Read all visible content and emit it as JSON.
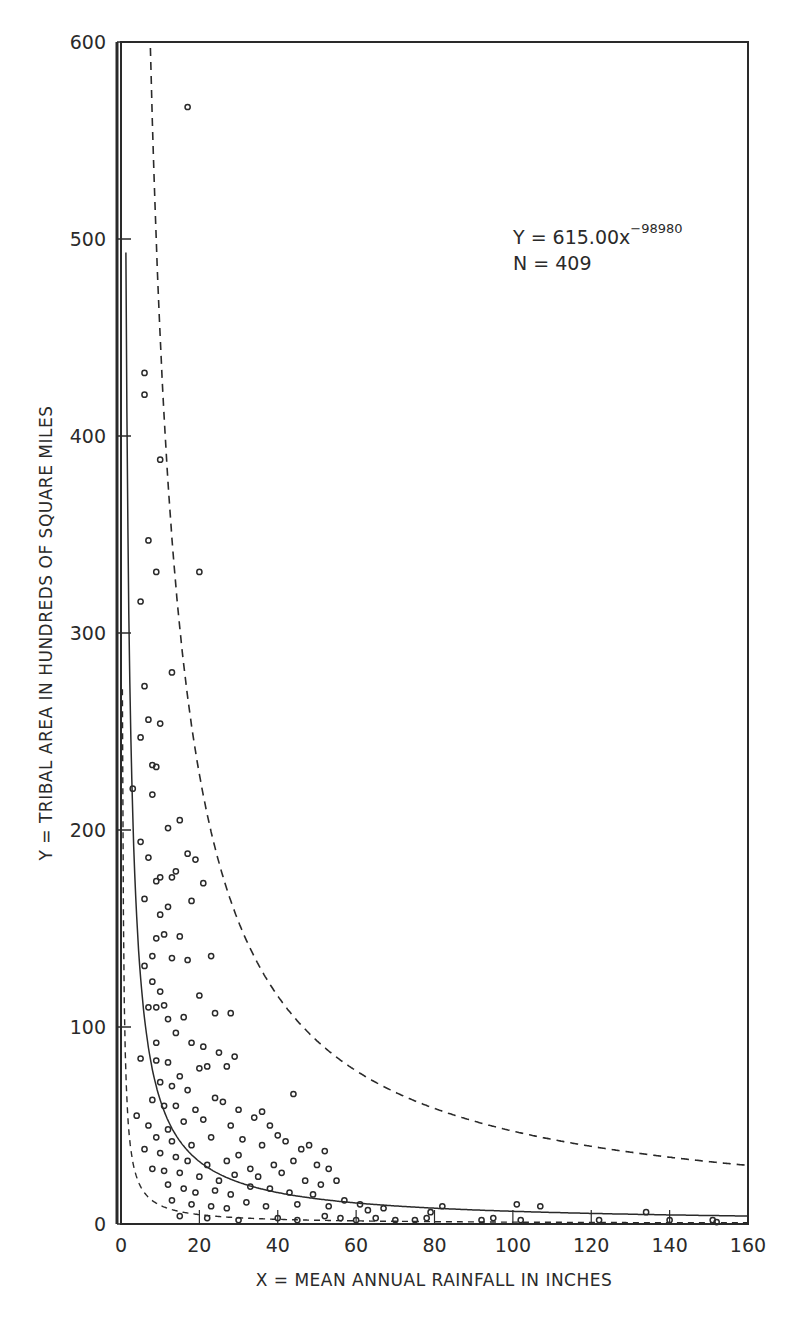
{
  "chart_data": {
    "type": "scatter",
    "title": "",
    "xlabel": "X = MEAN ANNUAL RAINFALL IN INCHES",
    "ylabel": "Y = TRIBAL AREA IN HUNDREDS OF SQUARE MILES",
    "xlim": [
      0,
      160
    ],
    "ylim": [
      0,
      600
    ],
    "xticks": [
      0,
      20,
      40,
      60,
      80,
      100,
      120,
      140,
      160
    ],
    "yticks": [
      0,
      100,
      200,
      300,
      400,
      500,
      600
    ],
    "grid": false,
    "legend": null,
    "annotations": [
      {
        "text": "Y = 615.00x",
        "superscript": "−98980",
        "x": 100,
        "y": 500
      },
      {
        "text": "N = 409",
        "x": 100,
        "y": 488
      }
    ],
    "fit_curve": {
      "name": "Regression fit",
      "equation": "Y = 615.00x^-0.98980",
      "coefficient": 615.0,
      "exponent": -0.9898,
      "style": "solid"
    },
    "bound_curves": [
      {
        "name": "Upper dashed bound",
        "coefficient": 4300,
        "exponent": -0.98,
        "style": "dashed"
      },
      {
        "name": "Lower dashed bound",
        "coefficient": 95,
        "exponent": -1.0,
        "style": "dashed"
      }
    ],
    "sample_size": 409,
    "series": [
      {
        "name": "Tribes",
        "marker": "open-circle",
        "points": [
          [
            17,
            567
          ],
          [
            6,
            432
          ],
          [
            6,
            421
          ],
          [
            10,
            388
          ],
          [
            20,
            331
          ],
          [
            7,
            347
          ],
          [
            9,
            331
          ],
          [
            5,
            316
          ],
          [
            13,
            280
          ],
          [
            6,
            273
          ],
          [
            7,
            256
          ],
          [
            5,
            247
          ],
          [
            10,
            254
          ],
          [
            8,
            233
          ],
          [
            9,
            232
          ],
          [
            3,
            221
          ],
          [
            8,
            218
          ],
          [
            5,
            194
          ],
          [
            15,
            205
          ],
          [
            12,
            201
          ],
          [
            17,
            188
          ],
          [
            19,
            185
          ],
          [
            7,
            186
          ],
          [
            9,
            174
          ],
          [
            10,
            176
          ],
          [
            14,
            179
          ],
          [
            13,
            176
          ],
          [
            18,
            164
          ],
          [
            21,
            173
          ],
          [
            6,
            165
          ],
          [
            12,
            161
          ],
          [
            10,
            157
          ],
          [
            11,
            147
          ],
          [
            15,
            146
          ],
          [
            9,
            145
          ],
          [
            8,
            136
          ],
          [
            13,
            135
          ],
          [
            23,
            136
          ],
          [
            17,
            134
          ],
          [
            6,
            131
          ],
          [
            8,
            123
          ],
          [
            10,
            118
          ],
          [
            9,
            110
          ],
          [
            7,
            110
          ],
          [
            11,
            111
          ],
          [
            12,
            104
          ],
          [
            20,
            116
          ],
          [
            24,
            107
          ],
          [
            28,
            107
          ],
          [
            16,
            105
          ],
          [
            14,
            97
          ],
          [
            9,
            92
          ],
          [
            18,
            92
          ],
          [
            21,
            90
          ],
          [
            25,
            87
          ],
          [
            5,
            84
          ],
          [
            9,
            83
          ],
          [
            12,
            82
          ],
          [
            20,
            79
          ],
          [
            15,
            75
          ],
          [
            22,
            80
          ],
          [
            10,
            72
          ],
          [
            13,
            70
          ],
          [
            17,
            68
          ],
          [
            27,
            80
          ],
          [
            29,
            85
          ],
          [
            8,
            63
          ],
          [
            11,
            60
          ],
          [
            14,
            60
          ],
          [
            19,
            58
          ],
          [
            24,
            64
          ],
          [
            26,
            62
          ],
          [
            30,
            58
          ],
          [
            36,
            57
          ],
          [
            44,
            66
          ],
          [
            4,
            55
          ],
          [
            7,
            50
          ],
          [
            12,
            48
          ],
          [
            16,
            52
          ],
          [
            21,
            53
          ],
          [
            28,
            50
          ],
          [
            34,
            54
          ],
          [
            38,
            50
          ],
          [
            40,
            45
          ],
          [
            9,
            44
          ],
          [
            13,
            42
          ],
          [
            18,
            40
          ],
          [
            23,
            44
          ],
          [
            31,
            43
          ],
          [
            36,
            40
          ],
          [
            42,
            42
          ],
          [
            46,
            38
          ],
          [
            48,
            40
          ],
          [
            52,
            37
          ],
          [
            6,
            38
          ],
          [
            10,
            36
          ],
          [
            14,
            34
          ],
          [
            17,
            32
          ],
          [
            22,
            30
          ],
          [
            27,
            32
          ],
          [
            30,
            35
          ],
          [
            33,
            28
          ],
          [
            39,
            30
          ],
          [
            44,
            32
          ],
          [
            50,
            30
          ],
          [
            53,
            28
          ],
          [
            55,
            22
          ],
          [
            8,
            28
          ],
          [
            11,
            27
          ],
          [
            15,
            26
          ],
          [
            20,
            24
          ],
          [
            25,
            22
          ],
          [
            29,
            25
          ],
          [
            35,
            24
          ],
          [
            41,
            26
          ],
          [
            47,
            22
          ],
          [
            51,
            20
          ],
          [
            12,
            20
          ],
          [
            16,
            18
          ],
          [
            19,
            16
          ],
          [
            24,
            17
          ],
          [
            28,
            15
          ],
          [
            33,
            19
          ],
          [
            38,
            18
          ],
          [
            43,
            16
          ],
          [
            49,
            15
          ],
          [
            57,
            12
          ],
          [
            61,
            10
          ],
          [
            13,
            12
          ],
          [
            18,
            10
          ],
          [
            23,
            9
          ],
          [
            27,
            8
          ],
          [
            32,
            11
          ],
          [
            37,
            9
          ],
          [
            45,
            10
          ],
          [
            53,
            9
          ],
          [
            63,
            7
          ],
          [
            67,
            8
          ],
          [
            79,
            6
          ],
          [
            82,
            9
          ],
          [
            101,
            10
          ],
          [
            107,
            9
          ],
          [
            134,
            6
          ],
          [
            15,
            4
          ],
          [
            22,
            3
          ],
          [
            30,
            2
          ],
          [
            40,
            3
          ],
          [
            45,
            2
          ],
          [
            52,
            4
          ],
          [
            56,
            3
          ],
          [
            60,
            2
          ],
          [
            65,
            3
          ],
          [
            70,
            2
          ],
          [
            75,
            2
          ],
          [
            78,
            3
          ],
          [
            92,
            2
          ],
          [
            95,
            3
          ],
          [
            102,
            2
          ],
          [
            122,
            2
          ],
          [
            140,
            2
          ],
          [
            151,
            2
          ],
          [
            152,
            1
          ]
        ]
      }
    ]
  },
  "axes": {
    "x_label": "X = MEAN ANNUAL RAINFALL IN INCHES",
    "y_label": "Y = TRIBAL AREA IN HUNDREDS OF SQUARE MILES",
    "x_tick_labels": [
      "0",
      "20",
      "40",
      "60",
      "80",
      "100",
      "120",
      "140",
      "160"
    ],
    "y_tick_labels": [
      "0",
      "100",
      "200",
      "300",
      "400",
      "500",
      "600"
    ]
  },
  "annotation": {
    "equation_main": "Y = 615.00x",
    "equation_exponent": "−98980",
    "n_label": "N = 409"
  },
  "colors": {
    "ink": "#2a2a2a",
    "background": "#ffffff"
  }
}
